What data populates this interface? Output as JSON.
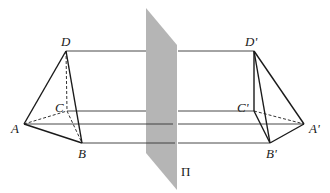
{
  "figure": {
    "plane": {
      "label": "Π",
      "color": "#b5b5b5"
    },
    "left_tetrahedron": {
      "labels": {
        "A": "A",
        "B": "B",
        "C": "C",
        "D": "D"
      },
      "visible_edges": [
        "AD",
        "DB",
        "AB"
      ],
      "hidden_edges": [
        "AC",
        "CB",
        "CD"
      ]
    },
    "right_tetrahedron": {
      "labels": {
        "A": "A'",
        "B": "B'",
        "C": "C'",
        "D": "D'"
      },
      "visible_edges": [
        "D'C'",
        "D'B'",
        "D'A'",
        "C'B'",
        "B'A'"
      ],
      "hidden_edges": [
        "C'A'"
      ]
    },
    "projection_lines": [
      "D-D'",
      "C-C'",
      "A-A'",
      "B-B'"
    ]
  }
}
